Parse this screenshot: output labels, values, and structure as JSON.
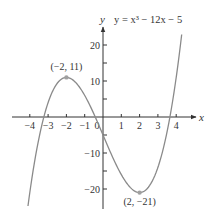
{
  "chart_data": {
    "type": "line",
    "title": "",
    "equation_label": "y = x³ − 12x − 5",
    "function": "x^3 - 12x - 5",
    "xlabel": "x",
    "ylabel": "y",
    "xlim": [
      -4.6,
      5.0
    ],
    "ylim": [
      -25,
      25
    ],
    "x_ticks": [
      -4,
      -3,
      -2,
      -1,
      0,
      1,
      2,
      3,
      4
    ],
    "x_tick_labels": [
      "−4",
      "−3",
      "−2",
      "−1",
      "0",
      "1",
      "2",
      "3",
      "4"
    ],
    "y_ticks": [
      -20,
      -15,
      -10,
      -5,
      5,
      10,
      15,
      20
    ],
    "y_tick_labels": [
      {
        "value": 20,
        "label": "20"
      },
      {
        "value": 10,
        "label": "10"
      },
      {
        "value": -10,
        "label": "−10"
      },
      {
        "value": -20,
        "label": "−20"
      }
    ],
    "grid": false,
    "series": [
      {
        "name": "y = x^3 - 12x - 5",
        "x": [
          -4.1,
          -3.5,
          -3,
          -2.5,
          -2,
          -1.5,
          -1,
          -0.5,
          0,
          0.5,
          1,
          1.5,
          2,
          2.5,
          3,
          3.5,
          4,
          4.3
        ],
        "y": [
          -24.7,
          -5.9,
          4,
          9.4,
          11,
          9.6,
          6,
          0.9,
          -5,
          -10.9,
          -16,
          -19.6,
          -21,
          -19.4,
          -14,
          -4.1,
          11,
          22.9
        ]
      }
    ],
    "annotations": [
      {
        "x": -2,
        "y": 11,
        "label": "(−2, 11)",
        "type": "local maximum"
      },
      {
        "x": 2,
        "y": -21,
        "label": "(2, −21)",
        "type": "local minimum"
      }
    ],
    "colors": {
      "curve": "#8a8a8a",
      "axes": "#333333",
      "points": "#a0a0a0"
    }
  }
}
